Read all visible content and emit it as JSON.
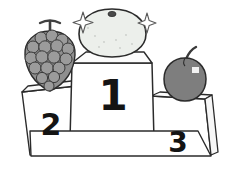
{
  "illustration": {
    "title": "fruit-winners-podium",
    "style": "hand-drawn grayscale sketch",
    "background_color": "#ffffff",
    "line_color": "#2b2b2b"
  },
  "podium": {
    "name": "three-place-winners-podium",
    "places": [
      {
        "rank_label": "1",
        "position": "center",
        "height_rank": "tallest",
        "face_color": "#ffffff",
        "winner": {
          "fruit": "grapefruit",
          "icon_name": "grapefruit-icon",
          "body_color": "#eceeea",
          "outline_color": "#2b2b2b",
          "mark": "navel-stem-spot",
          "mark_color": "#4a4a4a",
          "has_sparkles": true
        }
      },
      {
        "rank_label": "2",
        "position": "left",
        "height_rank": "middle",
        "face_color": "#ffffff",
        "winner": {
          "fruit": "grapes",
          "icon_name": "grapes-icon",
          "body_color": "#8a8a8a",
          "berry_shade": "#9a9a9a",
          "outline_color": "#2b2b2b",
          "stem_color": "#4a4a4a",
          "has_sparkles": false
        }
      },
      {
        "rank_label": "3",
        "position": "right",
        "height_rank": "shortest",
        "face_color": "#ffffff",
        "winner": {
          "fruit": "apple",
          "icon_name": "apple-icon",
          "body_color": "#7e7e7e",
          "outline_color": "#2b2b2b",
          "stem_color": "#3a3a3a",
          "highlight_color": "#f2f2f2",
          "has_sparkles": false
        }
      }
    ]
  },
  "decorations": {
    "sparkles": [
      {
        "name": "sparkle-left",
        "x": 83,
        "y": 22,
        "size": 11
      },
      {
        "name": "sparkle-right",
        "x": 146,
        "y": 23,
        "size": 10
      }
    ]
  }
}
